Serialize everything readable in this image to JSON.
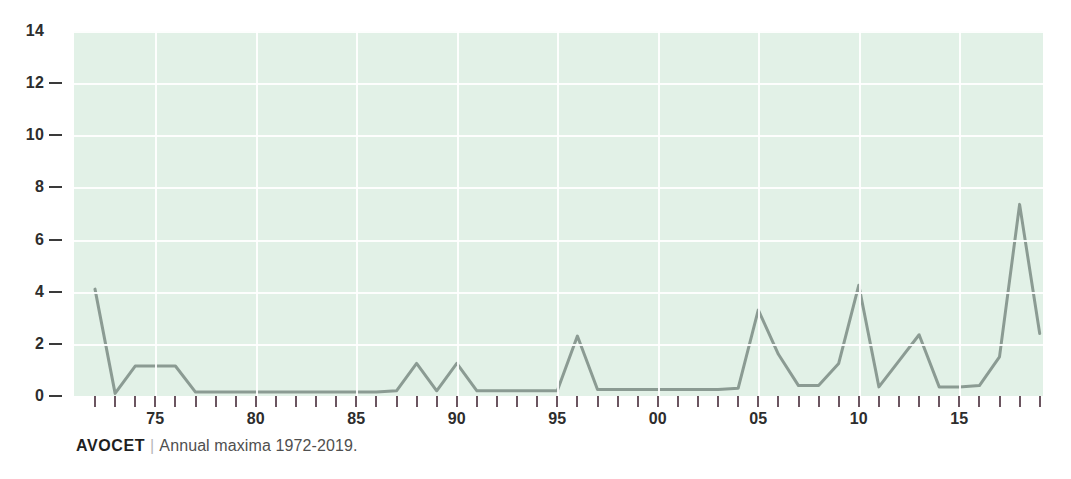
{
  "caption": {
    "species": "AVOCET",
    "separator": "|",
    "text": "Annual maxima 1972-2019."
  },
  "colors": {
    "panel_background": "#e2f1e7",
    "grid": "#ffffff",
    "line": "#8b9b93",
    "tick": "#6b5560",
    "text": "#2d2d2d",
    "caption_text": "#4f4f4f"
  },
  "chart_data": {
    "type": "line",
    "title": "",
    "subtitle": "",
    "xlabel": "",
    "ylabel": "",
    "xlim": [
      1972,
      2019
    ],
    "ylim": [
      0,
      14
    ],
    "grid": true,
    "legend": "none",
    "y_ticks": [
      0,
      2,
      4,
      6,
      8,
      10,
      12,
      14
    ],
    "y_tick_labels": [
      "0",
      "2",
      "4",
      "6",
      "8",
      "10",
      "12",
      "14"
    ],
    "x_ticks": [
      1975,
      1980,
      1985,
      1990,
      1995,
      2000,
      2005,
      2010,
      2015
    ],
    "x_tick_labels": [
      "75",
      "80",
      "85",
      "90",
      "95",
      "00",
      "05",
      "10",
      "15"
    ],
    "x_minor_ticks": [
      1972,
      1973,
      1974,
      1975,
      1976,
      1977,
      1978,
      1979,
      1980,
      1981,
      1982,
      1983,
      1984,
      1985,
      1986,
      1987,
      1988,
      1989,
      1990,
      1991,
      1992,
      1993,
      1994,
      1995,
      1996,
      1997,
      1998,
      1999,
      2000,
      2001,
      2002,
      2003,
      2004,
      2005,
      2006,
      2007,
      2008,
      2009,
      2010,
      2011,
      2012,
      2013,
      2014,
      2015,
      2016,
      2017,
      2018,
      2019
    ],
    "x": [
      1972,
      1973,
      1974,
      1975,
      1976,
      1977,
      1978,
      1979,
      1980,
      1981,
      1982,
      1983,
      1984,
      1985,
      1986,
      1987,
      1988,
      1989,
      1990,
      1991,
      1992,
      1993,
      1994,
      1995,
      1996,
      1997,
      1998,
      1999,
      2000,
      2001,
      2002,
      2003,
      2004,
      2005,
      2006,
      2007,
      2008,
      2009,
      2010,
      2011,
      2012,
      2013,
      2014,
      2015,
      2016,
      2017,
      2018,
      2019
    ],
    "values": [
      4.1,
      0.1,
      1.15,
      1.15,
      1.15,
      0.15,
      0.15,
      0.15,
      0.15,
      0.15,
      0.15,
      0.15,
      0.15,
      0.15,
      0.15,
      0.2,
      1.25,
      0.2,
      1.25,
      0.2,
      0.2,
      0.2,
      0.2,
      0.2,
      2.3,
      0.25,
      0.25,
      0.25,
      0.25,
      0.25,
      0.25,
      0.25,
      0.3,
      3.3,
      1.6,
      0.4,
      0.4,
      1.25,
      4.25,
      0.35,
      1.35,
      2.35,
      0.35,
      0.35,
      0.4,
      1.5,
      7.35,
      2.4
    ]
  }
}
